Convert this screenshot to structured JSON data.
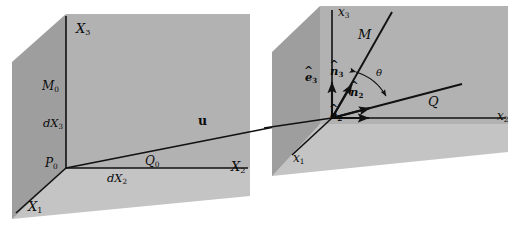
{
  "figure": {
    "kind": "continuum-mechanics-deformation-diagram",
    "background_color": "#ffffff",
    "plane_fill_color": "#a8a8a8",
    "floor_fill_color": "#bdbdbd",
    "wall_fill_color": "#b4b4b4",
    "line_color": "#111111",
    "text_color": "#0b0b0b"
  },
  "reference_config": {
    "axes": [
      {
        "name": "axis-X1",
        "label": "X",
        "sub": "1"
      },
      {
        "name": "axis-X2",
        "label": "X",
        "sub": "2"
      },
      {
        "name": "axis-X3",
        "label": "X",
        "sub": "3"
      }
    ],
    "points": [
      {
        "name": "point-P0",
        "label": "P",
        "sub": "0"
      },
      {
        "name": "point-M0",
        "label": "M",
        "sub": "0"
      },
      {
        "name": "point-Q0",
        "label": "Q",
        "sub": "0"
      }
    ],
    "segments": [
      {
        "name": "segment-dX2",
        "label": "dX",
        "sub": "2"
      },
      {
        "name": "segment-dX3",
        "label": "dX",
        "sub": "3"
      }
    ]
  },
  "displacement": {
    "name": "displacement-vector-u",
    "label": "u",
    "bold": true
  },
  "deformed_config": {
    "axes": [
      {
        "name": "axis-x1",
        "label": "x",
        "sub": "1"
      },
      {
        "name": "axis-x2",
        "label": "x",
        "sub": "2"
      },
      {
        "name": "axis-x3",
        "label": "x",
        "sub": "3"
      }
    ],
    "points": [
      {
        "name": "point-M",
        "label": "M",
        "sub": ""
      },
      {
        "name": "point-Q",
        "label": "Q",
        "sub": ""
      }
    ],
    "basis_vectors": [
      {
        "name": "unit-vector-e2",
        "label": "e",
        "sub": "2",
        "accent": "^"
      },
      {
        "name": "unit-vector-e3",
        "label": "e",
        "sub": "3",
        "accent": "^"
      },
      {
        "name": "unit-vector-n2",
        "label": "n",
        "sub": "2",
        "accent": "^"
      },
      {
        "name": "unit-vector-n3",
        "label": "n",
        "sub": "3",
        "accent": "^"
      }
    ],
    "angle": {
      "name": "angle-theta",
      "label": "θ"
    }
  }
}
